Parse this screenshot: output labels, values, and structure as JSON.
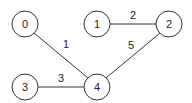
{
  "graph": {
    "nodes": [
      {
        "id": "0",
        "label": "0",
        "x": 25,
        "y": 24
      },
      {
        "id": "1",
        "label": "1",
        "x": 97,
        "y": 24
      },
      {
        "id": "2",
        "label": "2",
        "x": 169,
        "y": 24
      },
      {
        "id": "3",
        "label": "3",
        "x": 25,
        "y": 87
      },
      {
        "id": "4",
        "label": "4",
        "x": 97,
        "y": 87
      }
    ],
    "edges": [
      {
        "from": "0",
        "to": "4",
        "weight": "1",
        "label_x": 66,
        "label_y": 48
      },
      {
        "from": "1",
        "to": "2",
        "weight": "2",
        "label_x": 133,
        "label_y": 19
      },
      {
        "from": "2",
        "to": "4",
        "weight": "5",
        "label_x": 131,
        "label_y": 49
      },
      {
        "from": "3",
        "to": "4",
        "weight": "3",
        "label_x": 61,
        "label_y": 82
      }
    ],
    "node_radius": 13,
    "colors": {
      "stroke": "#333333",
      "fill": "#ffffff",
      "text": "#222222"
    }
  }
}
